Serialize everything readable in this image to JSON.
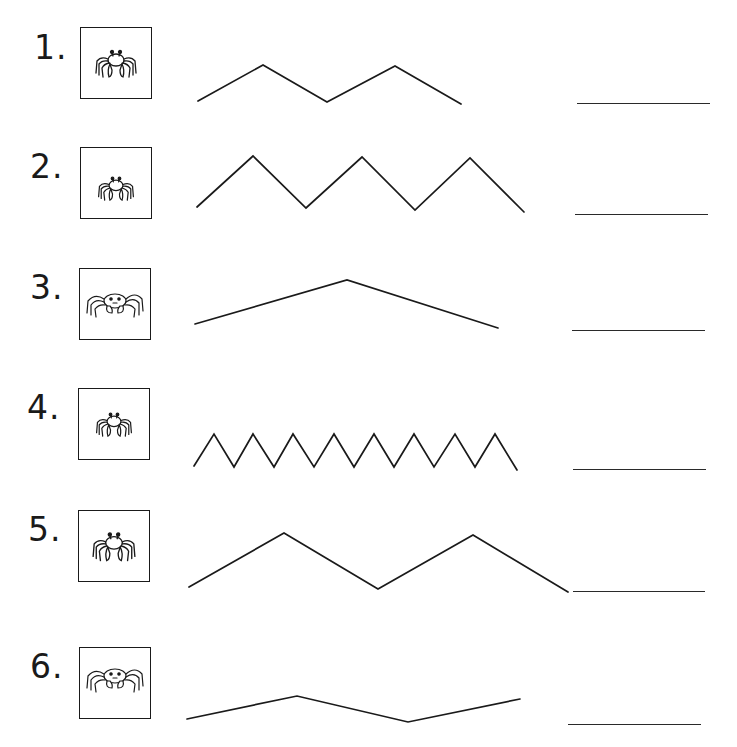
{
  "worksheet": {
    "items": [
      {
        "number": "1.",
        "crab_icon": "crab-icon-front-medium",
        "wave_points": "198,101 263,65 327,102 395,66 461,104",
        "answer_value": ""
      },
      {
        "number": "2.",
        "crab_icon": "crab-icon-front-small",
        "wave_points": "197,207 253,156 306,208 362,157 415,210 470,158 524,212",
        "answer_value": ""
      },
      {
        "number": "3.",
        "crab_icon": "crab-icon-side-large",
        "wave_points": "195,324 347,280 498,328",
        "answer_value": ""
      },
      {
        "number": "4.",
        "crab_icon": "crab-icon-front-small",
        "wave_points": "194,466 214,434 234,467 253,434 274,467 293,434 314,467 334,434 354,467 374,434 394,467 414,434 434,467 455,434 475,467 495,434 517,470",
        "answer_value": ""
      },
      {
        "number": "5.",
        "crab_icon": "crab-icon-front-medium",
        "wave_points": "189,587 284,533 378,589 473,535 568,592",
        "answer_value": ""
      },
      {
        "number": "6.",
        "crab_icon": "crab-icon-side-large",
        "wave_points": "187,719 297,696 408,722 520,699",
        "answer_value": ""
      }
    ],
    "colors": {
      "ink": "#1a1a1a",
      "paper": "#ffffff"
    }
  }
}
